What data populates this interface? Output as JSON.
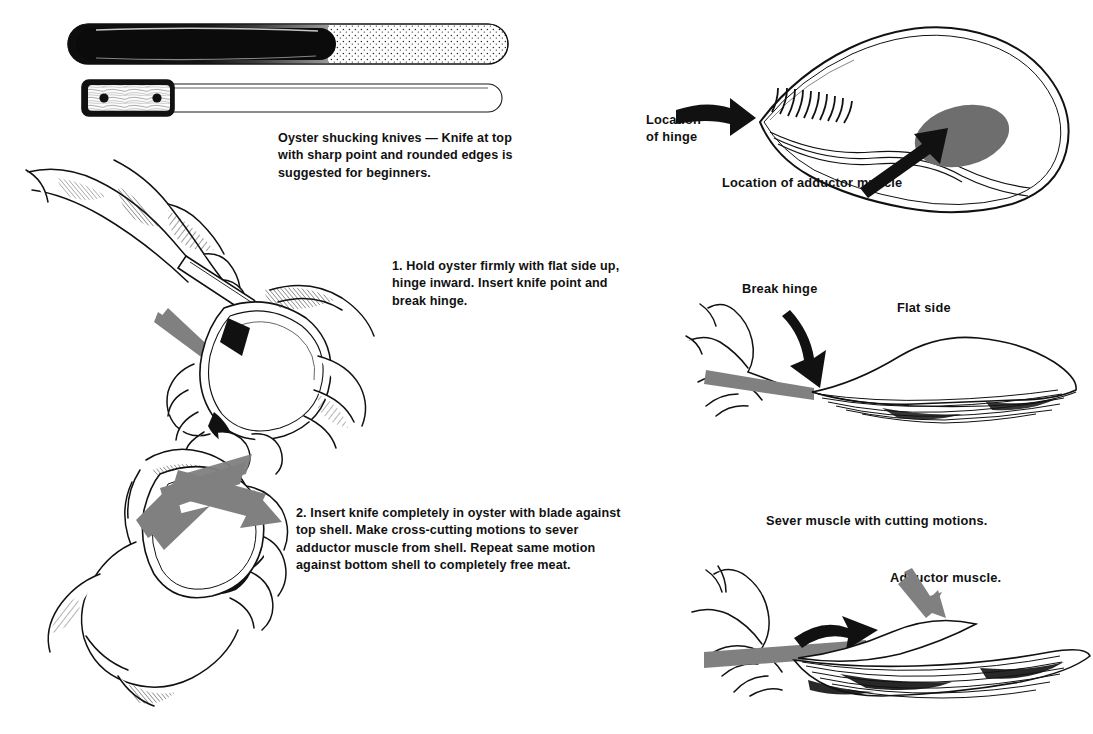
{
  "page": {
    "background": "#ffffff",
    "ink": "#111111",
    "arrow_gray": "#808080",
    "muscle_gray": "#6e6e6e"
  },
  "knives": {
    "caption": "Oyster shucking knives — Knife at top with sharp point and rounded edges is suggested for beginners.",
    "top_knife_name": "stippled-blade-knife",
    "bottom_knife_name": "wood-handle-riveted-knife",
    "rivet_count": 2
  },
  "steps": [
    {
      "number": "1.",
      "text": "1. Hold oyster firmly with flat side up, hinge inward. Insert knife point and break hinge."
    },
    {
      "number": "2.",
      "text": "2. Insert knife completely in oyster with blade against top shell. Make cross-cutting motions to sever adductor muscle from shell. Repeat same motion against bottom shell to completely free meat."
    }
  ],
  "anatomy": {
    "hinge_label": "Location\nof hinge",
    "hinge_label_line1": "Location",
    "hinge_label_line2": "of hinge",
    "adductor_label": "Location of adductor muscle"
  },
  "break_panel": {
    "break_label": "Break  hinge",
    "flat_label": "Flat side"
  },
  "sever_panel": {
    "heading": "Sever muscle with cutting motions.",
    "adductor_label": "Adductor muscle."
  }
}
